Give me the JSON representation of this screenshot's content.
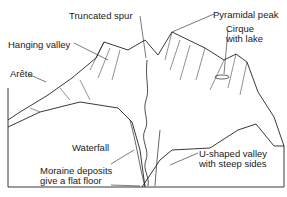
{
  "diagram": {
    "labels": {
      "truncated_spur": "Truncated spur",
      "pyramidal_peak": "Pyramidal peak",
      "cirque_line1": "Cirque",
      "cirque_line2": "with lake",
      "hanging_valley": "Hanging valley",
      "arete": "Arête",
      "waterfall": "Waterfall",
      "moraine_line1": "Moraine deposits",
      "moraine_line2": "give a flat floor",
      "u_valley_line1": "U-shaped valley",
      "u_valley_line2": "with steep sides"
    }
  }
}
